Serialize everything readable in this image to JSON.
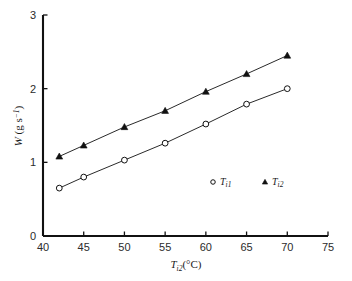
{
  "chart_data": {
    "type": "scatter",
    "title": "",
    "subtitle": "",
    "xlabel": "T_i2(°C)",
    "xlabel_parts": {
      "symbol": "T",
      "subscript": "i2",
      "unit": "(°C)"
    },
    "ylabel": "W (g s⁻¹)",
    "ylabel_parts": {
      "symbol": "W",
      "unit_open": " (g s",
      "exponent": "−1",
      "unit_close": ")"
    },
    "xlim": [
      40,
      75
    ],
    "ylim": [
      0,
      3
    ],
    "xticks": [
      40,
      45,
      50,
      55,
      60,
      65,
      70,
      75
    ],
    "yticks": [
      0,
      1,
      2,
      3
    ],
    "xtick_labels": [
      "40",
      "45",
      "50",
      "55",
      "60",
      "65",
      "70",
      "75"
    ],
    "ytick_labels": [
      "0",
      "1",
      "2",
      "3"
    ],
    "grid": false,
    "legend_position": "inside-lower-right",
    "x": [
      42,
      45,
      50,
      55,
      60,
      65,
      70
    ],
    "series": [
      {
        "name": "T_i1",
        "name_symbol": "T",
        "name_subscript": "i1",
        "marker": "open-circle",
        "color": "#000000",
        "values": [
          0.65,
          0.8,
          1.03,
          1.26,
          1.52,
          1.79,
          2.0
        ]
      },
      {
        "name": "T_i2",
        "name_symbol": "T",
        "name_subscript": "i2",
        "marker": "filled-triangle",
        "color": "#000000",
        "values": [
          1.08,
          1.23,
          1.48,
          1.7,
          1.96,
          2.2,
          2.45
        ]
      }
    ]
  },
  "legend": {
    "entries": [
      {
        "symbol": "T",
        "subscript": "i1",
        "marker": "open-circle"
      },
      {
        "symbol": "T",
        "subscript": "i2",
        "marker": "filled-triangle"
      }
    ]
  },
  "colors": {
    "axis": "#111111",
    "line": "#2a2a2a",
    "marker_fill": "#111111",
    "background": "#ffffff"
  }
}
